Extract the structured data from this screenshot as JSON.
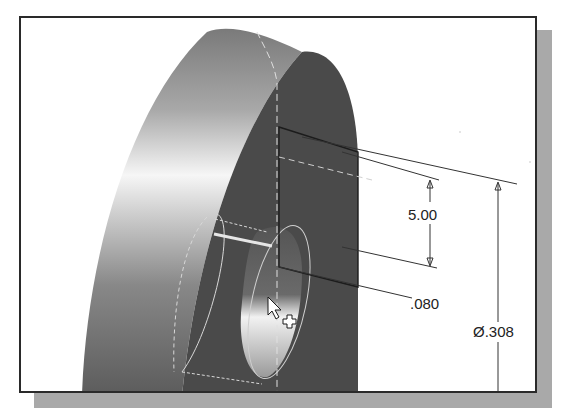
{
  "viewport": {
    "title": "3D model viewport",
    "dimensions": [
      {
        "id": "height-dim",
        "label": "5.00"
      },
      {
        "id": "depth-dim",
        "label": ".080"
      },
      {
        "id": "diameter-dim",
        "label": "Ø.308"
      }
    ],
    "cursor": {
      "type": "arrow-with-plus"
    }
  },
  "colors": {
    "frame_border": "#2a2a2a",
    "shadow": "#a9a9a9",
    "dark_face": "#4a4a4a",
    "cylinder_light": "#f2f2f2",
    "cylinder_mid": "#8a8a8a",
    "dimension_line": "#333333",
    "hidden_line": "#d8d8d8"
  }
}
